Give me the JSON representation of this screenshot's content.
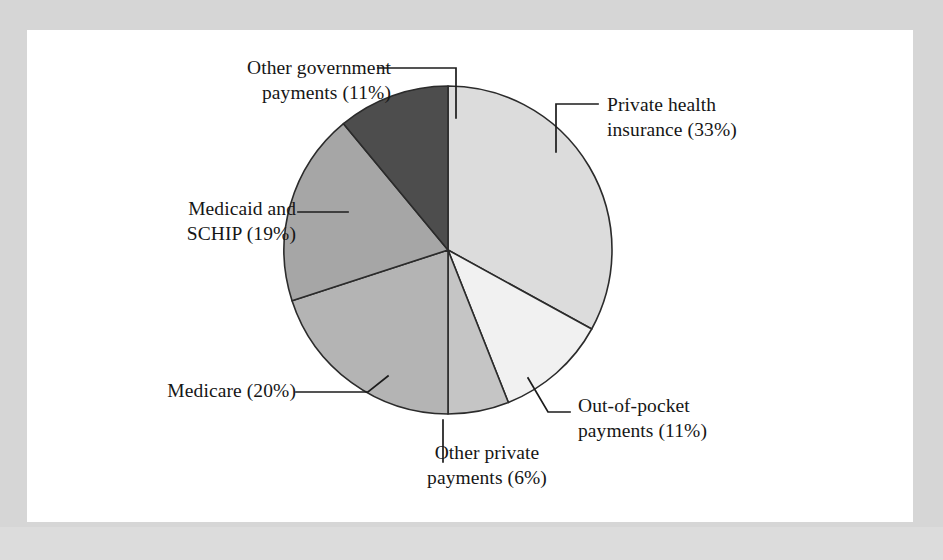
{
  "figure": {
    "background_color": "#d6d6d6",
    "sheet_color": "#ffffff",
    "text_color": "#161616",
    "outline_color": "#2b2b2b"
  },
  "chart_data": {
    "type": "pie",
    "title": "",
    "subtitle": "",
    "xlabel": "",
    "ylabel": "",
    "grid": false,
    "legend_position": "callout-labels",
    "start_angle_deg": 0,
    "direction": "clockwise",
    "units": "percent",
    "total": 100,
    "center": {
      "x": 448,
      "y": 250,
      "radius": 164
    },
    "categories": [
      "Private health insurance",
      "Out-of-pocket payments",
      "Other private payments",
      "Medicare",
      "Medicaid and SCHIP",
      "Other government payments"
    ],
    "values": [
      33,
      11,
      6,
      20,
      19,
      11
    ],
    "slices": [
      {
        "name": "private-health-insurance",
        "label": "Private health\ninsurance (33%)",
        "label_text": "Private health insurance (33%)",
        "value": 33,
        "percent": "33%",
        "color": "#dcdcdc",
        "start_deg": 0,
        "end_deg": 118.8
      },
      {
        "name": "out-of-pocket-payments",
        "label": "Out-of-pocket\npayments (11%)",
        "label_text": "Out-of-pocket payments (11%)",
        "value": 11,
        "percent": "11%",
        "color": "#f1f1f1",
        "start_deg": 118.8,
        "end_deg": 158.4
      },
      {
        "name": "other-private-payments",
        "label": "Other private\npayments (6%)",
        "label_text": "Other private payments (6%)",
        "value": 6,
        "percent": "6%",
        "color": "#c5c5c5",
        "start_deg": 158.4,
        "end_deg": 180.0
      },
      {
        "name": "medicare",
        "label": "Medicare (20%)",
        "label_text": "Medicare (20%)",
        "value": 20,
        "percent": "20%",
        "color": "#b4b4b4",
        "start_deg": 180.0,
        "end_deg": 252.0
      },
      {
        "name": "medicaid-and-schip",
        "label": "Medicaid and\nSCHIP (19%)",
        "label_text": "Medicaid and SCHIP (19%)",
        "value": 19,
        "percent": "19%",
        "color": "#a6a6a6",
        "start_deg": 252.0,
        "end_deg": 320.4
      },
      {
        "name": "other-government-payments",
        "label": "Other government\npayments (11%)",
        "label_text": "Other government payments (11%)",
        "value": 11,
        "percent": "11%",
        "color": "#4d4d4d",
        "start_deg": 320.4,
        "end_deg": 360.0
      }
    ]
  }
}
